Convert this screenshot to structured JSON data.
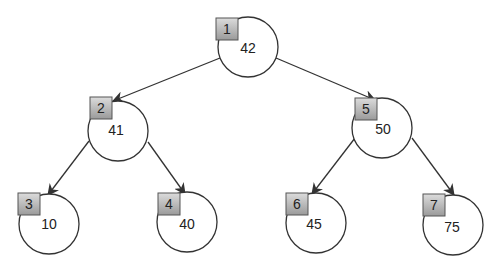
{
  "diagram": {
    "type": "binary-tree",
    "colors": {
      "stroke": "#333333",
      "box_top": "#d8d8d8",
      "box_bottom": "#9a9a9a",
      "text": "#222222"
    },
    "nodes": [
      {
        "index": "1",
        "value": "42",
        "cx": 248,
        "cy": 47,
        "bx": 216,
        "by": 18
      },
      {
        "index": "2",
        "value": "41",
        "cx": 118,
        "cy": 131,
        "bx": 90,
        "by": 97
      },
      {
        "index": "5",
        "value": "50",
        "cx": 382,
        "cy": 128,
        "bx": 355,
        "by": 98
      },
      {
        "index": "3",
        "value": "10",
        "cx": 49,
        "cy": 224,
        "bx": 18,
        "by": 193
      },
      {
        "index": "4",
        "value": "40",
        "cx": 187,
        "cy": 222,
        "bx": 158,
        "by": 193
      },
      {
        "index": "6",
        "value": "45",
        "cx": 316,
        "cy": 223,
        "bx": 286,
        "by": 193
      },
      {
        "index": "7",
        "value": "75",
        "cx": 453,
        "cy": 225,
        "bx": 423,
        "by": 194
      }
    ],
    "edges": [
      {
        "from": "1",
        "to": "2"
      },
      {
        "from": "1",
        "to": "5"
      },
      {
        "from": "2",
        "to": "3"
      },
      {
        "from": "2",
        "to": "4"
      },
      {
        "from": "5",
        "to": "6"
      },
      {
        "from": "5",
        "to": "7"
      }
    ]
  }
}
